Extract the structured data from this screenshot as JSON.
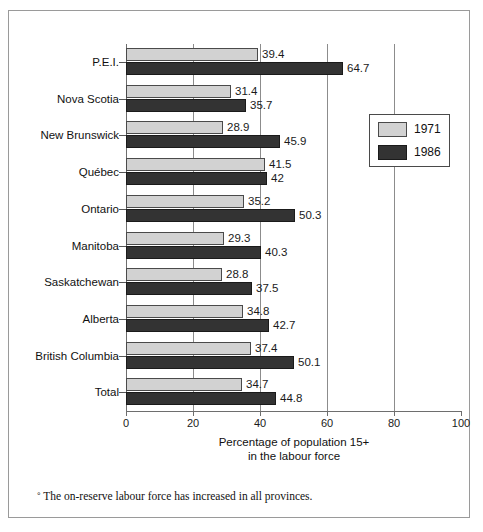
{
  "chart_data": {
    "type": "bar",
    "orientation": "horizontal",
    "title": "",
    "xlabel": "Percentage of population 15+ in the labour force",
    "ylabel": "",
    "xlim": [
      0,
      100
    ],
    "xticks": [
      0,
      20,
      40,
      60,
      80,
      100
    ],
    "grid": "vertical gridlines at 20, 40, 60, 80",
    "legend_position": "upper right, inside plot",
    "categories": [
      "P.E.I.",
      "Nova Scotia",
      "New Brunswick",
      "Québec",
      "Ontario",
      "Manitoba",
      "Saskatchewan",
      "Alberta",
      "British Columbia",
      "Total"
    ],
    "series": [
      {
        "name": "1971",
        "color": "#d2d2d2",
        "values": [
          39.4,
          31.4,
          28.9,
          41.5,
          35.2,
          29.3,
          28.8,
          34.8,
          37.4,
          34.7
        ],
        "labels": [
          "39.4",
          "31.4",
          "28.9",
          "41.5",
          "35.2",
          "29.3",
          "28.8",
          "34.8",
          "37.4",
          "34.7"
        ]
      },
      {
        "name": "1986",
        "color": "#333333",
        "values": [
          64.7,
          35.7,
          45.9,
          42.0,
          50.3,
          40.3,
          37.5,
          42.7,
          50.1,
          44.8
        ],
        "labels": [
          "64.7",
          "35.7",
          "45.9",
          "42",
          "50.3",
          "40.3",
          "37.5",
          "42.7",
          "50.1",
          "44.8"
        ]
      }
    ],
    "annotations": []
  },
  "axis": {
    "xlabel_line1": "Percentage of population 15+",
    "xlabel_line2": "in the labour force",
    "ticklabels": [
      "0",
      "20",
      "40",
      "60",
      "80",
      "100"
    ]
  },
  "legend": {
    "items": [
      {
        "label": "1971",
        "color": "#d2d2d2"
      },
      {
        "label": "1986",
        "color": "#333333"
      }
    ]
  },
  "footnote": {
    "marker": "°",
    "text": "The on-reserve labour force has increased in all provinces."
  },
  "colors": {
    "series_1971": "#d2d2d2",
    "series_1986": "#333333",
    "frame": "#9a9a9a",
    "axis": "#6e6e6e",
    "background": "#ffffff"
  }
}
